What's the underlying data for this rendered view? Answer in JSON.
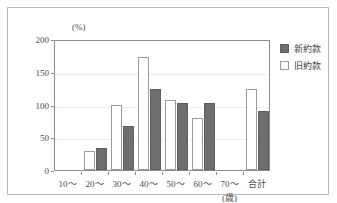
{
  "chart_data": {
    "type": "bar",
    "title": "",
    "subtitle": "",
    "xlabel": "(歳)",
    "ylabel": "(%)",
    "ylim": [
      0,
      200
    ],
    "yticks": [
      0,
      50,
      100,
      150,
      200
    ],
    "ytick_labels": [
      "0",
      "50",
      "100",
      "150",
      "200"
    ],
    "grid": true,
    "legend_position": "right-outside",
    "categories": [
      "10～",
      "20～",
      "30～",
      "40～",
      "50～",
      "60～",
      "70～",
      "合計"
    ],
    "series": [
      {
        "name": "新約款",
        "color": "#6e6e6e",
        "style": "filled",
        "values": [
          null,
          33,
          67,
          124,
          102,
          102,
          null,
          90
        ]
      },
      {
        "name": "旧約款",
        "color": "#ffffff",
        "style": "outline",
        "values": [
          null,
          29,
          100,
          173,
          107,
          80,
          null,
          124
        ]
      }
    ],
    "series_draw_order": [
      "旧約款",
      "新約款"
    ]
  },
  "legend": {
    "items": [
      {
        "label": "新約款",
        "swatch": "filled-dark-square"
      },
      {
        "label": "旧約款",
        "swatch": "open-white-square"
      }
    ]
  },
  "colors": {
    "bar_new_fill": "#6e6e6e",
    "bar_new_stroke": "#5e5e5e",
    "bar_old_fill": "#ffffff",
    "bar_old_stroke": "#9a9a9a",
    "axis": "#8d8d8d",
    "grid": "#ededed",
    "frame": "#b9b9b9",
    "text": "#4a4a4a",
    "background": "#ffffff"
  }
}
